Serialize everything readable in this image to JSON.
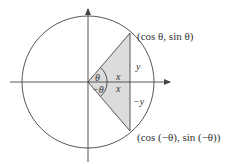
{
  "diagram": {
    "colors": {
      "stroke": "#444444",
      "shade": "#dcdcdc",
      "text": "#333333"
    },
    "labels": {
      "point_top": "(cos θ, sin θ)",
      "point_bottom": "(cos (−θ), sin (−θ))",
      "angle_pos": "θ",
      "angle_neg": "−θ",
      "x_top": "x",
      "x_bottom": "x",
      "y_top": "y",
      "y_bottom": "−y"
    },
    "elements": {
      "axes": [
        "x-axis",
        "y-axis"
      ],
      "circle": "unit circle",
      "shaded_region": "triangle from origin to (cos θ, ±sin θ)",
      "chord": "vertical segment x = cos θ"
    }
  }
}
